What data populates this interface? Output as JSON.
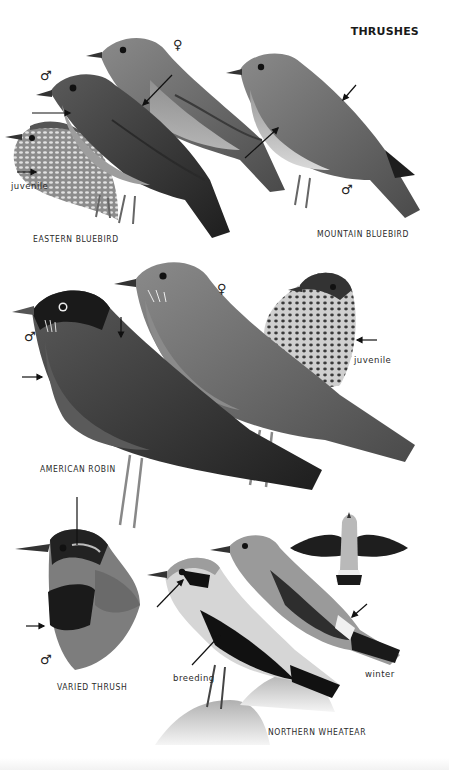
{
  "page": {
    "title": "THRUSHES",
    "colors": {
      "background": "#ffffff",
      "ink": "#1a1a1a",
      "plumage_dark": "#2b2b2b",
      "plumage_mid": "#6f6f6f",
      "plumage_light": "#a9a9a9",
      "belly_pale": "#dcdcdc"
    }
  },
  "species": [
    {
      "id": "eastern-bluebird",
      "name": "EASTERN BLUEBIRD",
      "figures": [
        {
          "sex": "♂",
          "note": ""
        },
        {
          "sex": "♀",
          "note": ""
        },
        {
          "sex": "",
          "note": "juvenile"
        }
      ]
    },
    {
      "id": "mountain-bluebird",
      "name": "MOUNTAIN BLUEBIRD",
      "figures": [
        {
          "sex": "♂",
          "note": ""
        }
      ]
    },
    {
      "id": "american-robin",
      "name": "AMERICAN ROBIN",
      "figures": [
        {
          "sex": "♂",
          "note": ""
        },
        {
          "sex": "♀",
          "note": ""
        },
        {
          "sex": "",
          "note": "juvenile"
        }
      ]
    },
    {
      "id": "varied-thrush",
      "name": "VARIED THRUSH",
      "figures": [
        {
          "sex": "♂",
          "note": ""
        }
      ]
    },
    {
      "id": "northern-wheatear",
      "name": "NORTHERN WHEATEAR",
      "figures": [
        {
          "sex": "",
          "note": "breeding"
        },
        {
          "sex": "",
          "note": "winter"
        },
        {
          "sex": "",
          "note": "flight"
        }
      ]
    }
  ]
}
